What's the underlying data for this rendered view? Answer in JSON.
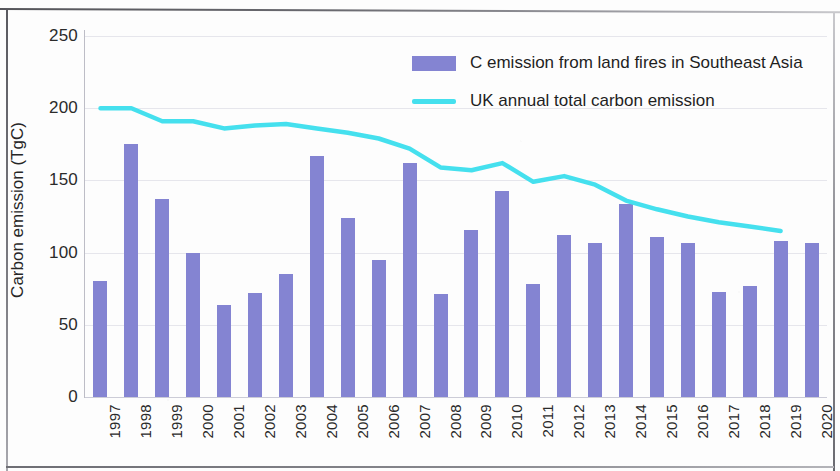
{
  "chart_data": {
    "type": "bar",
    "title": "",
    "xlabel": "",
    "ylabel": "Carbon emission (TgC)",
    "ylim": [
      0,
      250
    ],
    "ytick_values": [
      250,
      200,
      150,
      100,
      50,
      0
    ],
    "ytick_labels": [
      "250",
      "200",
      "150",
      "100",
      "50",
      "0"
    ],
    "grid": true,
    "legend_position": "top-right",
    "categories": [
      "1997",
      "1998",
      "1999",
      "2000",
      "2001",
      "2002",
      "2003",
      "2004",
      "2005",
      "2006",
      "2007",
      "2008",
      "2009",
      "2010",
      "2011",
      "2012",
      "2013",
      "2014",
      "2015",
      "2016",
      "2017",
      "2018",
      "2019",
      "2020"
    ],
    "series": [
      {
        "name": "C emission from land fires in Southeast Asia",
        "type": "bar",
        "color": "#8484d2",
        "values": [
          80,
          175,
          137,
          100,
          64,
          72,
          85,
          167,
          124,
          95,
          162,
          71,
          116,
          143,
          78,
          112,
          107,
          134,
          111,
          107,
          73,
          77,
          108,
          107
        ]
      },
      {
        "name": "UK annual total carbon emission",
        "type": "line",
        "color": "#45e0ee",
        "x": [
          "1997",
          "1998",
          "1999",
          "2000",
          "2001",
          "2002",
          "2003",
          "2004",
          "2005",
          "2006",
          "2007",
          "2008",
          "2009",
          "2010",
          "2011",
          "2012",
          "2013",
          "2014",
          "2015",
          "2016",
          "2017",
          "2018",
          "2019"
        ],
        "values": [
          200,
          200,
          191,
          191,
          186,
          188,
          189,
          186,
          183,
          179,
          172,
          159,
          157,
          162,
          149,
          153,
          147,
          136,
          130,
          125,
          121,
          118,
          115
        ]
      }
    ],
    "legend": [
      {
        "label": "C emission from land fires in Southeast Asia",
        "marker": "bar-swatch",
        "color": "#8484d2"
      },
      {
        "label": "UK annual total carbon emission",
        "marker": "line-swatch",
        "color": "#45e0ee"
      }
    ]
  }
}
